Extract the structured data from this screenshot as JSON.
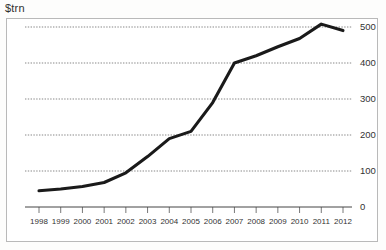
{
  "chart_data": {
    "type": "line",
    "title": "$trn",
    "xlabel": "",
    "ylabel": "$trn",
    "categories": [
      "1998",
      "1999",
      "2000",
      "2001",
      "2002",
      "2003",
      "2004",
      "2005",
      "2006",
      "2007",
      "2008",
      "2009",
      "2010",
      "2011",
      "2012"
    ],
    "x": [
      1998,
      1999,
      2000,
      2001,
      2002,
      2003,
      2004,
      2005,
      2006,
      2007,
      2008,
      2009,
      2010,
      2011,
      2012
    ],
    "values": [
      45,
      50,
      57,
      68,
      95,
      140,
      190,
      210,
      290,
      400,
      420,
      445,
      468,
      508,
      490
    ],
    "series": [
      {
        "name": "$trn",
        "values": [
          45,
          50,
          57,
          68,
          95,
          140,
          190,
          210,
          290,
          400,
          420,
          445,
          468,
          508,
          490
        ]
      }
    ],
    "ylim": [
      0,
      560
    ],
    "yticks": [
      0,
      100,
      200,
      300,
      400,
      500
    ],
    "ytick_labels": [
      "0",
      "100",
      "200",
      "300",
      "400",
      "500"
    ],
    "xtick_labels": [
      "1998",
      "1999",
      "2000",
      "2001",
      "2002",
      "2003",
      "2004",
      "2005",
      "2006",
      "2007",
      "2008",
      "2009",
      "2010",
      "2011",
      "2012"
    ],
    "grid": true,
    "grid_axis": "y",
    "legend": false,
    "legend_position": "none",
    "y_axis_side": "right",
    "line_color": "#1a1a1a",
    "grid_color": "#555555",
    "frame_color": "#b9b9b9",
    "background_color": "#ffffff"
  }
}
